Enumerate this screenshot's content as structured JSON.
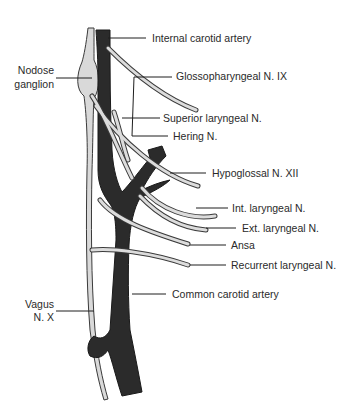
{
  "figure": {
    "colors": {
      "artery": "#2b2b2b",
      "nerve_fill": "#d9d9d9",
      "nerve_outline": "#3a3a3a",
      "ganglion": "#d6d6d6",
      "leader": "#1e1e1e",
      "text": "#2a2a2a",
      "background": "#ffffff"
    },
    "labels": {
      "internal_carotid": "Internal carotid artery",
      "nodose_line1": "Nodose",
      "nodose_line2": "ganglion",
      "glossopharyngeal": "Glossopharyngeal N. IX",
      "superior_laryngeal": "Superior laryngeal N.",
      "hering": "Hering N.",
      "hypoglossal": "Hypoglossal N. XII",
      "int_laryngeal": "Int. laryngeal N.",
      "ext_laryngeal": "Ext. laryngeal N.",
      "ansa": "Ansa",
      "recurrent_laryngeal": "Recurrent laryngeal N.",
      "common_carotid": "Common carotid artery",
      "vagus_line1": "Vagus",
      "vagus_line2": "N. X"
    }
  }
}
